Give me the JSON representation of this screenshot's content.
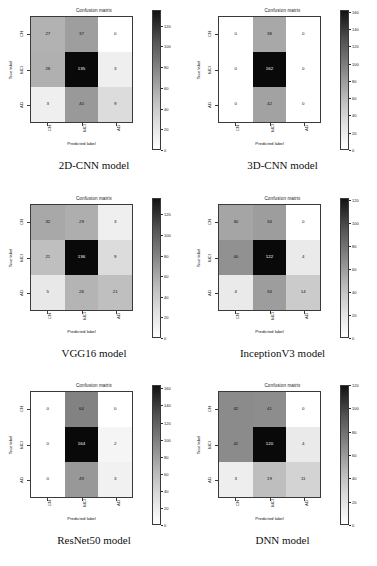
{
  "figure": {
    "panel_title": "Confusion matrix",
    "xlabel": "Predicted label",
    "ylabel": "True label",
    "class_labels": [
      "CN",
      "MCI",
      "AD"
    ]
  },
  "chart_data": [
    {
      "type": "heatmap",
      "title": "Confusion matrix",
      "caption": "2D-CNN model",
      "xlabel": "Predicted label",
      "ylabel": "True label",
      "categories": [
        "CN",
        "MCI",
        "AD"
      ],
      "matrix": [
        [
          27,
          37,
          0
        ],
        [
          28,
          135,
          3
        ],
        [
          3,
          40,
          9
        ]
      ],
      "colorbar": {
        "min": 0,
        "max": 135,
        "ticks": [
          0,
          20,
          40,
          60,
          80,
          100,
          120
        ]
      },
      "grid": false
    },
    {
      "type": "heatmap",
      "title": "Confusion matrix",
      "caption": "3D-CNN model",
      "xlabel": "Predicted label",
      "ylabel": "True label",
      "categories": [
        "CN",
        "MCI",
        "AD"
      ],
      "matrix": [
        [
          0,
          38,
          0
        ],
        [
          0,
          162,
          0
        ],
        [
          0,
          42,
          0
        ]
      ],
      "colorbar": {
        "min": 0,
        "max": 162,
        "ticks": [
          0,
          20,
          40,
          60,
          80,
          100,
          120,
          140,
          160
        ]
      },
      "grid": false
    },
    {
      "type": "heatmap",
      "title": "Confusion matrix",
      "caption": "VGG16 model",
      "xlabel": "Predicted label",
      "ylabel": "True label",
      "categories": [
        "CN",
        "MCI",
        "AD"
      ],
      "matrix": [
        [
          32,
          29,
          3
        ],
        [
          21,
          136,
          9
        ],
        [
          5,
          26,
          21
        ]
      ],
      "colorbar": {
        "min": 0,
        "max": 136,
        "ticks": [
          0,
          20,
          40,
          60,
          80,
          100,
          120
        ]
      },
      "grid": false
    },
    {
      "type": "heatmap",
      "title": "Confusion matrix",
      "caption": "InceptionV3 model",
      "xlabel": "Predicted label",
      "ylabel": "True label",
      "categories": [
        "CN",
        "MCI",
        "AD"
      ],
      "matrix": [
        [
          30,
          34,
          0
        ],
        [
          40,
          122,
          4
        ],
        [
          4,
          34,
          14
        ]
      ],
      "colorbar": {
        "min": 0,
        "max": 122,
        "ticks": [
          0,
          20,
          40,
          60,
          80,
          100,
          120
        ]
      },
      "grid": false
    },
    {
      "type": "heatmap",
      "title": "Confusion matrix",
      "caption": "ResNet50 model",
      "xlabel": "Predicted label",
      "ylabel": "True label",
      "categories": [
        "CN",
        "MCI",
        "AD"
      ],
      "matrix": [
        [
          0,
          64,
          0
        ],
        [
          0,
          164,
          2
        ],
        [
          0,
          49,
          3
        ]
      ],
      "colorbar": {
        "min": 0,
        "max": 164,
        "ticks": [
          0,
          20,
          40,
          60,
          80,
          100,
          120,
          140,
          160
        ]
      },
      "grid": false
    },
    {
      "type": "heatmap",
      "title": "Confusion matrix",
      "caption": "DNN model",
      "xlabel": "Predicted label",
      "ylabel": "True label",
      "categories": [
        "CN",
        "MCI",
        "AD"
      ],
      "matrix": [
        [
          42,
          41,
          0
        ],
        [
          42,
          120,
          4
        ],
        [
          3,
          19,
          11
        ]
      ],
      "colorbar": {
        "min": 0,
        "max": 120,
        "ticks": [
          0,
          20,
          40,
          60,
          80,
          100,
          120
        ]
      },
      "grid": false
    }
  ]
}
